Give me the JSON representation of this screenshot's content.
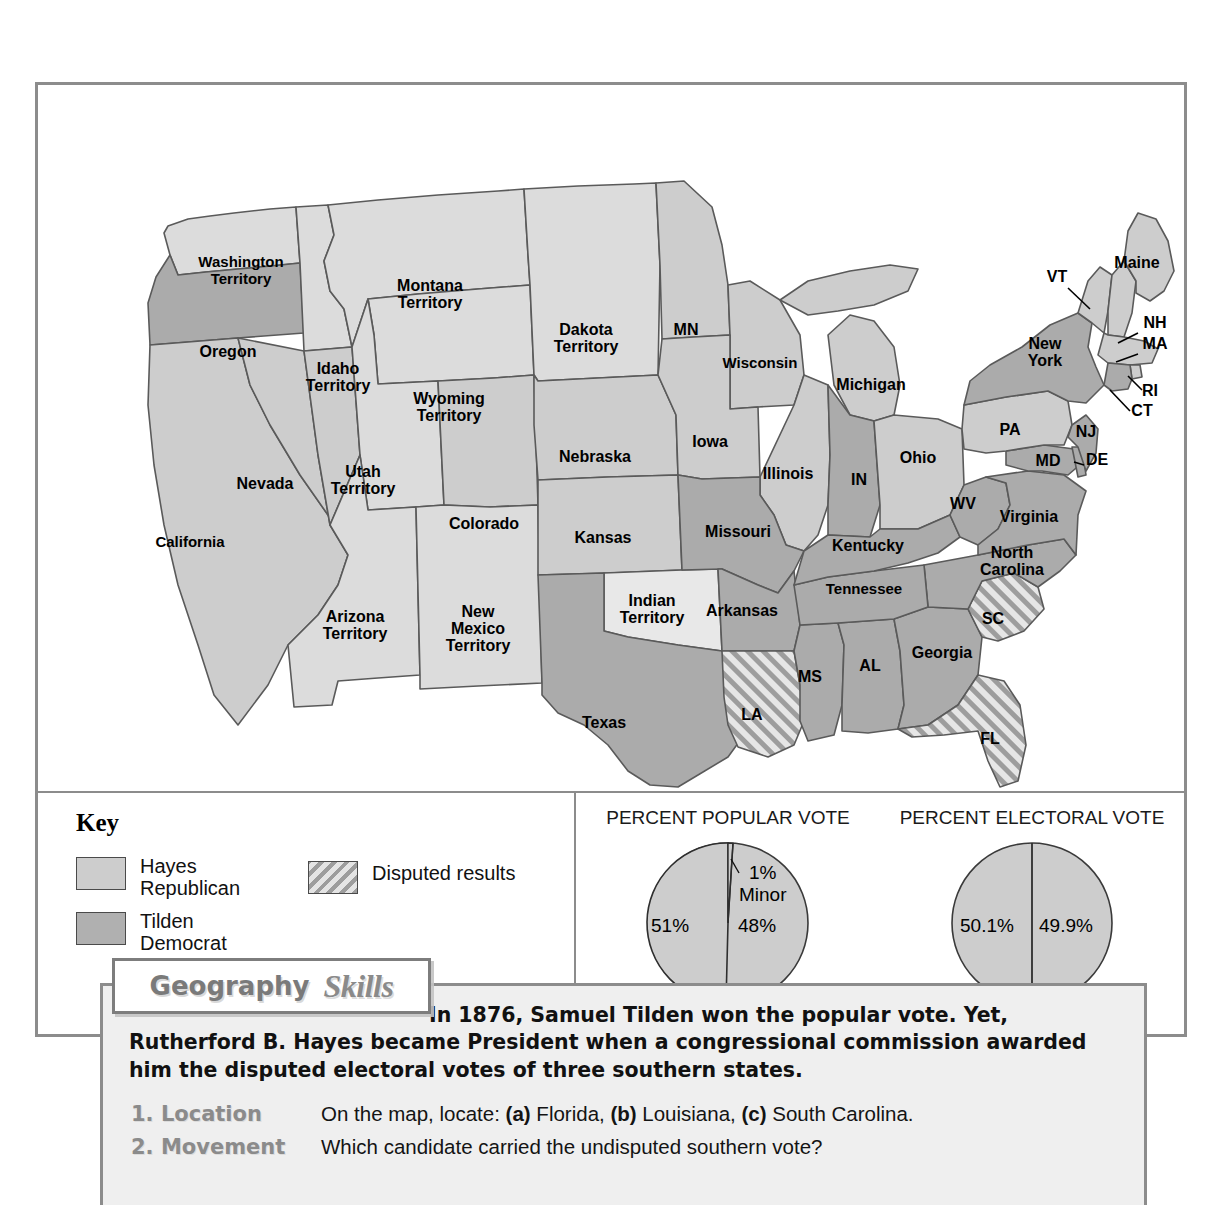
{
  "key": {
    "heading": "Key",
    "entries": [
      {
        "name": "hayes",
        "label": "Hayes\nRepublican",
        "color": "#cdcdcd"
      },
      {
        "name": "tilden",
        "label": "Tilden\nDemocrat",
        "color": "#b0b0b0"
      },
      {
        "name": "disputed",
        "label": "Disputed results",
        "color": "#9d9d9d"
      }
    ]
  },
  "charts": {
    "popular": {
      "caption": "PERCENT POPULAR VOTE",
      "left_label": "51%",
      "right_label": "48%",
      "minor_label": "1%\nMinor"
    },
    "electoral": {
      "caption": "PERCENT ELECTORAL VOTE",
      "left_label": "50.1%",
      "right_label": "49.9%"
    }
  },
  "chart_data": [
    {
      "type": "pie",
      "title": "PERCENT POPULAR VOTE",
      "categories": [
        "Tilden (Democrat)",
        "Hayes (Republican)",
        "Minor"
      ],
      "values": [
        51,
        48,
        1
      ],
      "labels": [
        "51%",
        "48%",
        "1% Minor"
      ],
      "legend": "none",
      "unit": "percent"
    },
    {
      "type": "pie",
      "title": "PERCENT ELECTORAL VOTE",
      "categories": [
        "Hayes (Republican)",
        "Tilden (Democrat)"
      ],
      "values": [
        50.1,
        49.9
      ],
      "labels": [
        "50.1%",
        "49.9%"
      ],
      "legend": "none",
      "unit": "percent"
    }
  ],
  "geography": {
    "banner_word1": "Geography",
    "banner_word2": "Skills",
    "intro": "In 1876, Samuel Tilden won the popular vote. Yet, Rutherford B. Hayes became President when a congressional commission awarded him the disputed electoral votes of three southern states.",
    "questions": [
      {
        "number_skill": "1. Location",
        "text_pre": "On the map, locate: ",
        "a": "(a)",
        "a_text": " Florida, ",
        "b": "(b)",
        "b_text": " Louisiana, ",
        "c": "(c)",
        "c_text": " South Carolina."
      },
      {
        "number_skill": "2. Movement",
        "text_pre": "Which candidate carried the undisputed southern vote?",
        "a": "",
        "a_text": "",
        "b": "",
        "b_text": "",
        "c": "",
        "c_text": ""
      }
    ]
  },
  "map": {
    "fill_hayes": "#cdcdcd",
    "fill_tilden": "#ababab",
    "fill_territory": "#dcdcdc",
    "stroke": "#5a5a5a",
    "labels": [
      {
        "id": "washington-territory",
        "text": "Washington\nTerritory",
        "x": 203,
        "y": 190
      },
      {
        "id": "oregon",
        "text": "Oregon",
        "x": 190,
        "y": 272
      },
      {
        "id": "idaho-territory",
        "text": "Idaho\nTerritory",
        "x": 300,
        "y": 297
      },
      {
        "id": "montana-territory",
        "text": "Montana\nTerritory",
        "x": 392,
        "y": 214
      },
      {
        "id": "wyoming-territory",
        "text": "Wyoming\nTerritory",
        "x": 411,
        "y": 327
      },
      {
        "id": "dakota-territory",
        "text": "Dakota\nTerritory",
        "x": 548,
        "y": 258
      },
      {
        "id": "minnesota",
        "text": "MN",
        "x": 648,
        "y": 250
      },
      {
        "id": "wisconsin",
        "text": "Wisconsin",
        "x": 722,
        "y": 283
      },
      {
        "id": "michigan",
        "text": "Michigan",
        "x": 833,
        "y": 305
      },
      {
        "id": "nevada",
        "text": "Nevada",
        "x": 227,
        "y": 404
      },
      {
        "id": "california",
        "text": "California",
        "x": 152,
        "y": 462
      },
      {
        "id": "utah-territory",
        "text": "Utah\nTerritory",
        "x": 325,
        "y": 400
      },
      {
        "id": "colorado",
        "text": "Colorado",
        "x": 446,
        "y": 444
      },
      {
        "id": "nebraska",
        "text": "Nebraska",
        "x": 557,
        "y": 377
      },
      {
        "id": "kansas",
        "text": "Kansas",
        "x": 565,
        "y": 458
      },
      {
        "id": "iowa",
        "text": "Iowa",
        "x": 672,
        "y": 362
      },
      {
        "id": "illinois",
        "text": "Illinois",
        "x": 750,
        "y": 394
      },
      {
        "id": "indiana",
        "text": "IN",
        "x": 821,
        "y": 400
      },
      {
        "id": "ohio",
        "text": "Ohio",
        "x": 880,
        "y": 378
      },
      {
        "id": "pennsylvania",
        "text": "PA",
        "x": 972,
        "y": 350
      },
      {
        "id": "new-york",
        "text": "New\nYork",
        "x": 1007,
        "y": 272
      },
      {
        "id": "maine",
        "text": "Maine",
        "x": 1099,
        "y": 183
      },
      {
        "id": "vermont",
        "text": "VT",
        "x": 1019,
        "y": 197
      },
      {
        "id": "new-hampshire",
        "text": "NH",
        "x": 1117,
        "y": 243
      },
      {
        "id": "massachusetts",
        "text": "MA",
        "x": 1117,
        "y": 264
      },
      {
        "id": "rhode-island",
        "text": "RI",
        "x": 1112,
        "y": 311
      },
      {
        "id": "connecticut",
        "text": "CT",
        "x": 1104,
        "y": 331
      },
      {
        "id": "new-jersey",
        "text": "NJ",
        "x": 1048,
        "y": 352
      },
      {
        "id": "maryland",
        "text": "MD",
        "x": 1010,
        "y": 381
      },
      {
        "id": "delaware",
        "text": "DE",
        "x": 1059,
        "y": 380
      },
      {
        "id": "west-virginia",
        "text": "WV",
        "x": 925,
        "y": 424
      },
      {
        "id": "virginia",
        "text": "Virginia",
        "x": 991,
        "y": 437
      },
      {
        "id": "missouri",
        "text": "Missouri",
        "x": 700,
        "y": 452
      },
      {
        "id": "kentucky",
        "text": "Kentucky",
        "x": 830,
        "y": 466
      },
      {
        "id": "tennessee",
        "text": "Tennessee",
        "x": 826,
        "y": 509
      },
      {
        "id": "north-carolina",
        "text": "North\nCarolina",
        "x": 974,
        "y": 481
      },
      {
        "id": "south-carolina",
        "text": "SC",
        "x": 955,
        "y": 539
      },
      {
        "id": "arkansas",
        "text": "Arkansas",
        "x": 704,
        "y": 531
      },
      {
        "id": "indian-territory",
        "text": "Indian\nTerritory",
        "x": 614,
        "y": 529
      },
      {
        "id": "new-mexico-territory",
        "text": "New\nMexico\nTerritory",
        "x": 440,
        "y": 549
      },
      {
        "id": "arizona-territory",
        "text": "Arizona\nTerritory",
        "x": 317,
        "y": 545
      },
      {
        "id": "texas",
        "text": "Texas",
        "x": 566,
        "y": 643
      },
      {
        "id": "louisiana",
        "text": "LA",
        "x": 714,
        "y": 635
      },
      {
        "id": "mississippi",
        "text": "MS",
        "x": 772,
        "y": 597
      },
      {
        "id": "alabama",
        "text": "AL",
        "x": 832,
        "y": 586
      },
      {
        "id": "georgia",
        "text": "Georgia",
        "x": 904,
        "y": 573
      },
      {
        "id": "florida",
        "text": "FL",
        "x": 952,
        "y": 659
      }
    ]
  }
}
